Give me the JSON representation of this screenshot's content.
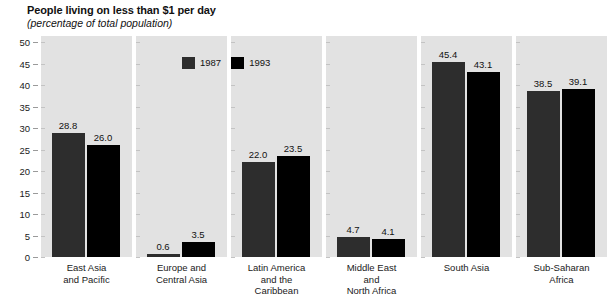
{
  "chart_data": {
    "type": "bar",
    "title": "People living on less than $1 per day",
    "subtitle": "(percentage of total population)",
    "xlabel": "",
    "ylabel": "",
    "ylim": [
      0,
      50
    ],
    "yticks": [
      0,
      5,
      10,
      15,
      20,
      25,
      30,
      35,
      40,
      45,
      50
    ],
    "grid": false,
    "legend_position": "top-center",
    "categories": [
      "East Asia\nand Pacific",
      "Europe and\nCentral Asia",
      "Latin America\nand the\nCaribbean",
      "Middle East\nand\nNorth Africa",
      "South Asia",
      "Sub-Saharan\nAfrica"
    ],
    "series": [
      {
        "name": "1987",
        "color": "#2d2d2d",
        "values": [
          28.8,
          0.6,
          22.0,
          4.7,
          45.4,
          38.5
        ]
      },
      {
        "name": "1993",
        "color": "#000000",
        "values": [
          26.0,
          3.5,
          23.5,
          4.1,
          43.1,
          39.1
        ]
      }
    ],
    "value_labels": [
      [
        "28.8",
        "26.0"
      ],
      [
        "0.6",
        "3.5"
      ],
      [
        "22.0",
        "23.5"
      ],
      [
        "4.7",
        "4.1"
      ],
      [
        "45.4",
        "43.1"
      ],
      [
        "38.5",
        "39.1"
      ]
    ]
  },
  "legend": {
    "items": [
      {
        "label": "1987"
      },
      {
        "label": "1993"
      }
    ]
  },
  "categories_display": [
    {
      "lines": [
        "East Asia",
        "and Pacific"
      ]
    },
    {
      "lines": [
        "Europe and",
        "Central Asia"
      ]
    },
    {
      "lines": [
        "Latin America",
        "and the",
        "Caribbean"
      ]
    },
    {
      "lines": [
        "Middle East",
        "and",
        "North Africa"
      ]
    },
    {
      "lines": [
        "South Asia"
      ]
    },
    {
      "lines": [
        "Sub-Saharan",
        "Africa"
      ]
    }
  ],
  "colors": {
    "panel_background": "#e2e2e2",
    "series_1987": "#2d2d2d",
    "series_1993": "#000000",
    "page_background": "#ffffff",
    "text": "#1a1a1a"
  }
}
